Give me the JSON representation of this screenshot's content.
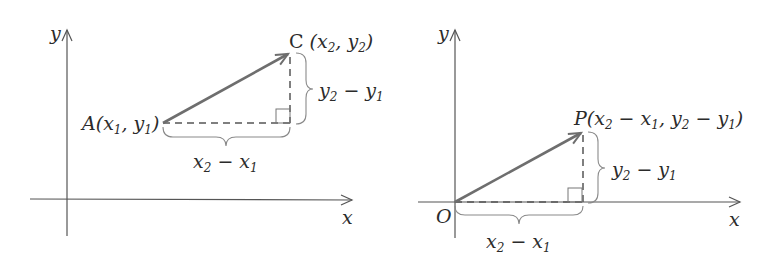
{
  "figure": {
    "left_panel": {
      "axis_x_label": "x",
      "axis_y_label": "y",
      "point_A": {
        "name": "A",
        "label": "A(x₁, y₁)",
        "coords": "(x₁, y₁)"
      },
      "point_C": {
        "name": "C",
        "label": "C (x₂, y₂)",
        "coords": "(x₂, y₂)"
      },
      "horizontal_brace_label": "x₂ − x₁",
      "vertical_brace_label": "y₂ − y₁",
      "vector": "A → C"
    },
    "right_panel": {
      "axis_x_label": "x",
      "axis_y_label": "y",
      "origin_label": "O",
      "point_P": {
        "name": "P",
        "label": "P(x₂ − x₁, y₂ − y₁)",
        "coords": "(x₂ − x₁, y₂ − y₁)"
      },
      "horizontal_brace_label": "x₂ − x₁",
      "vertical_brace_label": "y₂ − y₁",
      "vector": "O → P"
    },
    "colors": {
      "axis": "#555555",
      "vector": "#6e6e6e",
      "brace": "#8a8a8a",
      "text": "#2b2b2b"
    }
  }
}
